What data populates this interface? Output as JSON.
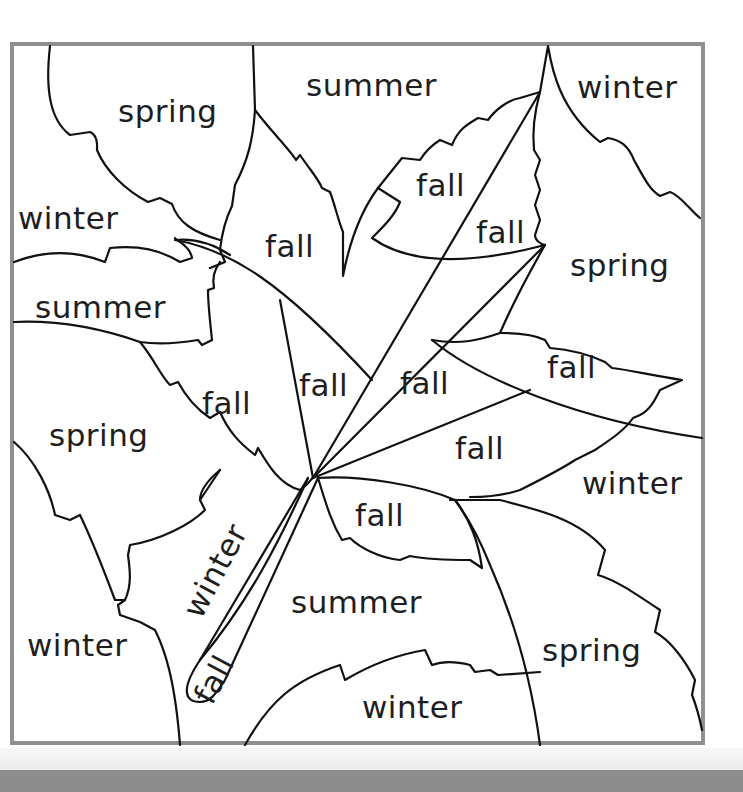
{
  "worksheet": {
    "frame_color": "#8f8f8f",
    "line_color": "#111111",
    "text_color": "#1e1e1e",
    "regions": [
      {
        "id": "r1",
        "label": "spring",
        "x": 118,
        "y": 96,
        "rotate": 0
      },
      {
        "id": "r2",
        "label": "summer",
        "x": 306,
        "y": 70,
        "rotate": 0
      },
      {
        "id": "r3",
        "label": "winter",
        "x": 577,
        "y": 72,
        "rotate": 0
      },
      {
        "id": "r4",
        "label": "winter",
        "x": 18,
        "y": 203,
        "rotate": 0
      },
      {
        "id": "r5",
        "label": "fall",
        "x": 265,
        "y": 231,
        "rotate": 0
      },
      {
        "id": "r6",
        "label": "fall",
        "x": 416,
        "y": 170,
        "rotate": 0
      },
      {
        "id": "r7",
        "label": "fall",
        "x": 476,
        "y": 217,
        "rotate": 0
      },
      {
        "id": "r8",
        "label": "spring",
        "x": 570,
        "y": 250,
        "rotate": 0
      },
      {
        "id": "r9",
        "label": "summer",
        "x": 35,
        "y": 292,
        "rotate": 0
      },
      {
        "id": "r10",
        "label": "fall",
        "x": 299,
        "y": 370,
        "rotate": 0
      },
      {
        "id": "r11",
        "label": "fall",
        "x": 400,
        "y": 368,
        "rotate": 0
      },
      {
        "id": "r12",
        "label": "fall",
        "x": 547,
        "y": 352,
        "rotate": 0
      },
      {
        "id": "r13",
        "label": "fall",
        "x": 202,
        "y": 388,
        "rotate": 0
      },
      {
        "id": "r14",
        "label": "spring",
        "x": 49,
        "y": 420,
        "rotate": 0
      },
      {
        "id": "r15",
        "label": "fall",
        "x": 455,
        "y": 433,
        "rotate": 0
      },
      {
        "id": "r16",
        "label": "winter",
        "x": 582,
        "y": 468,
        "rotate": 0
      },
      {
        "id": "r17",
        "label": "fall",
        "x": 355,
        "y": 500,
        "rotate": 0
      },
      {
        "id": "r18",
        "label": "winter",
        "x": 178,
        "y": 608,
        "rotate": -62
      },
      {
        "id": "r19",
        "label": "summer",
        "x": 291,
        "y": 587,
        "rotate": 0
      },
      {
        "id": "r20",
        "label": "winter",
        "x": 27,
        "y": 630,
        "rotate": 0
      },
      {
        "id": "r21",
        "label": "spring",
        "x": 542,
        "y": 635,
        "rotate": 0
      },
      {
        "id": "r22",
        "label": "fall",
        "x": 189,
        "y": 694,
        "rotate": -62
      },
      {
        "id": "r23",
        "label": "winter",
        "x": 362,
        "y": 692,
        "rotate": 0
      }
    ]
  }
}
